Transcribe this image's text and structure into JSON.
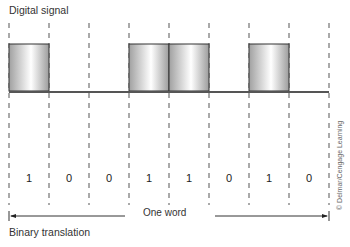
{
  "title": "Digital signal",
  "footer": "Binary translation",
  "word_label": "One word",
  "credit": "© Delmar/Cengage Learning",
  "bits": [
    "1",
    "0",
    "0",
    "1",
    "1",
    "0",
    "1",
    "0"
  ],
  "colors": {
    "box_stroke": "#333333",
    "box_light": "#ffffff",
    "box_dark": "#9a9a9a",
    "baseline": "#555555",
    "dash": "#555555"
  }
}
